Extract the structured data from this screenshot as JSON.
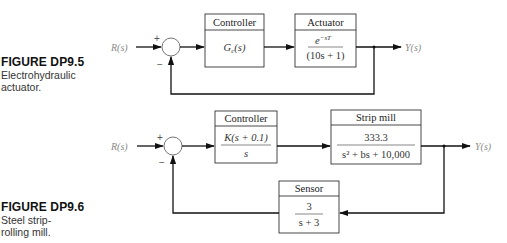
{
  "figures": [
    {
      "id": "DP9.5",
      "caption_title": "FIGURE DP9.5",
      "caption_lines": [
        "Electrohydraulic",
        "actuator."
      ],
      "input_label": "R(s)",
      "output_label": "Y(s)",
      "sum_signs": {
        "plus": "+",
        "minus": "−"
      },
      "blocks": [
        {
          "name": "controller",
          "header": "Controller",
          "tf_single": "Gc(s)"
        },
        {
          "name": "actuator",
          "header": "Actuator",
          "numerator": "e^{-sT}",
          "num_base": "e",
          "num_sup": "−sT",
          "denominator": "(10s + 1)"
        }
      ]
    },
    {
      "id": "DP9.6",
      "caption_title": "FIGURE DP9.6",
      "caption_lines": [
        "Steel strip-",
        "rolling mill."
      ],
      "input_label": "R(s)",
      "output_label": "Y(s)",
      "sum_signs": {
        "plus": "+",
        "minus": "−"
      },
      "blocks": [
        {
          "name": "controller",
          "header": "Controller",
          "numerator": "K(s + 0.1)",
          "denominator": "s"
        },
        {
          "name": "strip-mill",
          "header": "Strip mill",
          "numerator": "333.3",
          "denominator": "s² + bs + 10,000"
        },
        {
          "name": "sensor",
          "header": "Sensor",
          "numerator": "3",
          "denominator": "s + 3"
        }
      ]
    }
  ]
}
